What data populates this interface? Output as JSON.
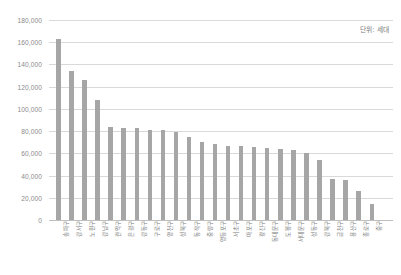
{
  "chart_data": {
    "type": "bar",
    "title": "",
    "subtitle": "",
    "xlabel": "",
    "ylabel": "",
    "unit_note": "단위: 세대",
    "ylim": [
      0,
      180000
    ],
    "ytick_step": 20000,
    "grid": true,
    "legend": false,
    "legend_position": "none",
    "bar_color": "#a6a6a6",
    "ytick_labels": [
      "180,000",
      "160,000",
      "140,000",
      "120,000",
      "100,000",
      "80,000",
      "60,000",
      "40,000",
      "20,000",
      "0"
    ],
    "ytick_values": [
      180000,
      160000,
      140000,
      120000,
      100000,
      80000,
      60000,
      40000,
      20000,
      0
    ],
    "categories": [
      "송파구",
      "강서구",
      "노원구",
      "강남구",
      "관악구",
      "은평구",
      "강동구",
      "구로구",
      "양천구",
      "성북구",
      "동작구",
      "중랑구",
      "영등포구",
      "서초구",
      "마포구",
      "광진구",
      "동대문구",
      "도봉구",
      "서대문구",
      "성동구",
      "강북구",
      "금천구",
      "용산구",
      "종로구",
      "중구"
    ],
    "values": [
      163000,
      134000,
      126000,
      108000,
      84000,
      83000,
      83000,
      81000,
      81000,
      79000,
      75000,
      70000,
      68000,
      67000,
      67000,
      66000,
      65000,
      64000,
      63000,
      60000,
      54000,
      37000,
      36000,
      26000,
      14000
    ]
  },
  "axis": {
    "y_title": "",
    "x_title": ""
  }
}
